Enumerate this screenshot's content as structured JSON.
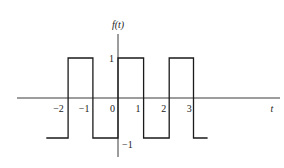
{
  "chart_data": {
    "type": "line",
    "title": "",
    "ylabel": "f(t)",
    "xlabel": "t",
    "x_ticks": [
      -2,
      -1,
      0,
      1,
      2,
      3
    ],
    "x_tick_labels": [
      "−2",
      "−1",
      "0",
      "1",
      "2",
      "3"
    ],
    "y_ticks": [
      1,
      -1
    ],
    "y_tick_labels": [
      "1",
      "−1"
    ],
    "xlim": [
      -4,
      6.3
    ],
    "ylim": [
      -1.6,
      1.6
    ],
    "grid": false,
    "series": [
      {
        "name": "f(t)",
        "description": "square wave, period 2",
        "x": [
          -2.8,
          -1.95,
          -1.95,
          -0.98,
          -0.98,
          0,
          0,
          1,
          1,
          2,
          2,
          2.95,
          2.95,
          3.5
        ],
        "y": [
          -1,
          -1,
          1,
          1,
          -1,
          -1,
          1,
          1,
          -1,
          -1,
          1,
          1,
          -1,
          -1
        ]
      }
    ]
  }
}
